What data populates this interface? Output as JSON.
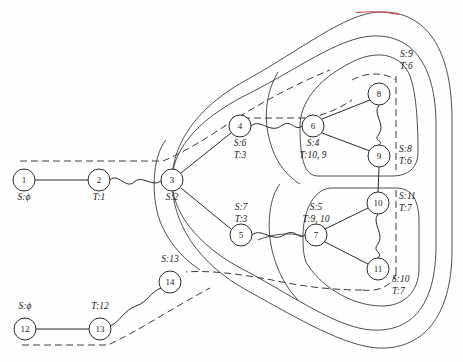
{
  "figure": {
    "caption": ""
  },
  "colors": {
    "ink": "#2b2b2b",
    "region": "#3a3a3a",
    "accent_red": "#d94b4b",
    "background": "#ffffff"
  },
  "nodes": [
    {
      "id": "1",
      "label": "1",
      "x": 24,
      "y": 180,
      "r": 11,
      "tag": "S:ϕ",
      "tag_x": 24,
      "tag_y": 200,
      "tag_anchor": "middle"
    },
    {
      "id": "2",
      "label": "2",
      "x": 99,
      "y": 180,
      "r": 11,
      "tag": "T:1",
      "tag_x": 99,
      "tag_y": 200,
      "tag_anchor": "middle"
    },
    {
      "id": "3",
      "label": "3",
      "x": 172,
      "y": 180,
      "r": 11,
      "tag": "S:2",
      "tag_x": 172,
      "tag_y": 200,
      "tag_anchor": "middle"
    },
    {
      "id": "4",
      "label": "4",
      "x": 240,
      "y": 126,
      "r": 11,
      "tag": "S:6",
      "tag_x": 240,
      "tag_y": 146,
      "tag_anchor": "middle",
      "tag2": "T:3",
      "tag2_x": 240,
      "tag2_y": 158
    },
    {
      "id": "5",
      "label": "5",
      "x": 241,
      "y": 235,
      "r": 11,
      "tag": "S:7",
      "tag_x": 241,
      "tag_y": 210,
      "tag_anchor": "middle",
      "tag2": "T:3",
      "tag2_x": 241,
      "tag2_y": 222
    },
    {
      "id": "6",
      "label": "6",
      "x": 313,
      "y": 126,
      "r": 11,
      "tag": "S:4",
      "tag_x": 313,
      "tag_y": 146,
      "tag_anchor": "middle",
      "tag2": "T:10, 9",
      "tag2_x": 313,
      "tag2_y": 158
    },
    {
      "id": "7",
      "label": "7",
      "x": 316,
      "y": 235,
      "r": 11,
      "tag": "S:5",
      "tag_x": 316,
      "tag_y": 210,
      "tag_anchor": "middle",
      "tag2": "T:9, 10",
      "tag2_x": 316,
      "tag2_y": 222
    },
    {
      "id": "8",
      "label": "8",
      "x": 379,
      "y": 94,
      "r": 11,
      "tag": "S:9",
      "tag_x": 400,
      "tag_y": 57,
      "tag_anchor": "start",
      "tag2": "T:6",
      "tag2_x": 400,
      "tag2_y": 69
    },
    {
      "id": "9",
      "label": "9",
      "x": 379,
      "y": 156,
      "r": 11,
      "tag": "S:8",
      "tag_x": 399,
      "tag_y": 152,
      "tag_anchor": "start",
      "tag2": "T:6",
      "tag2_x": 399,
      "tag2_y": 164
    },
    {
      "id": "10",
      "label": "10",
      "x": 378,
      "y": 203,
      "r": 11,
      "tag": "S:11",
      "tag_x": 399,
      "tag_y": 199,
      "tag_anchor": "start",
      "tag2": "T:7",
      "tag2_x": 399,
      "tag2_y": 211
    },
    {
      "id": "11",
      "label": "11",
      "x": 378,
      "y": 269,
      "r": 11,
      "tag": "S:10",
      "tag_x": 392,
      "tag_y": 282,
      "tag_anchor": "start",
      "tag2": "T:7",
      "tag2_x": 392,
      "tag2_y": 294
    },
    {
      "id": "12",
      "label": "12",
      "x": 25,
      "y": 329,
      "r": 11,
      "tag": "S:ϕ",
      "tag_x": 25,
      "tag_y": 309,
      "tag_anchor": "middle"
    },
    {
      "id": "13",
      "label": "13",
      "x": 100,
      "y": 329,
      "r": 11,
      "tag": "T:12",
      "tag_x": 100,
      "tag_y": 309,
      "tag_anchor": "middle"
    },
    {
      "id": "14",
      "label": "14",
      "x": 170,
      "y": 282,
      "r": 11,
      "tag": "S:13",
      "tag_x": 170,
      "tag_y": 262,
      "tag_anchor": "middle"
    }
  ],
  "edges": [
    {
      "from": "1",
      "to": "2",
      "style": "straight"
    },
    {
      "from": "2",
      "to": "3",
      "style": "wavy"
    },
    {
      "from": "3",
      "to": "4",
      "style": "straight"
    },
    {
      "from": "3",
      "to": "5",
      "style": "straight"
    },
    {
      "from": "4",
      "to": "6",
      "style": "wavy"
    },
    {
      "from": "5",
      "to": "7",
      "style": "wavy"
    },
    {
      "from": "6",
      "to": "8",
      "style": "straight"
    },
    {
      "from": "6",
      "to": "9",
      "style": "straight"
    },
    {
      "from": "8",
      "to": "9",
      "style": "wavy"
    },
    {
      "from": "7",
      "to": "10",
      "style": "straight"
    },
    {
      "from": "7",
      "to": "11",
      "style": "straight"
    },
    {
      "from": "10",
      "to": "11",
      "style": "wavy"
    },
    {
      "from": "9",
      "to": "10",
      "style": "straight"
    },
    {
      "from": "12",
      "to": "13",
      "style": "straight"
    },
    {
      "from": "13",
      "to": "14",
      "style": "wavy"
    }
  ],
  "region_labels": {
    "r8": "S:9 / T:6",
    "r9": "S:8 / T:6",
    "r10": "S:11 / T:7",
    "r11": "S:10 / T:7"
  },
  "legend": {
    "solid": "region boundary",
    "dashed": "cut / separator"
  }
}
